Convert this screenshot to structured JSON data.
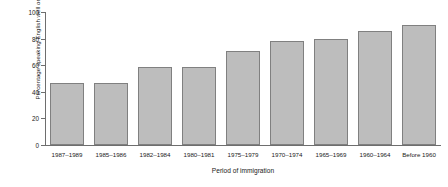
{
  "chart_data": {
    "type": "bar",
    "title": "",
    "subtitle": "",
    "xlabel": "Period of immigration",
    "ylabel": "Percentage speaking English well or very well",
    "categories": [
      "1987–1989",
      "1985–1986",
      "1982–1984",
      "1980–1981",
      "1975–1979",
      "1970–1974",
      "1965–1969",
      "1960–1964",
      "Before 1960"
    ],
    "values": [
      47,
      47,
      59,
      59,
      71,
      78,
      80,
      86,
      90
    ],
    "ylim": [
      0,
      100
    ],
    "yticks": [
      0,
      20,
      40,
      60,
      80,
      100
    ],
    "ytick_labels": [
      "0",
      "20",
      "40",
      "60",
      "80",
      "100"
    ],
    "grid": false,
    "legend": null,
    "legend_position": "none",
    "bar_fill_color": "#bdbdbd",
    "bar_border_color": "#808080",
    "axis_color": "#6e6e6e",
    "background_color": "#ffffff"
  }
}
